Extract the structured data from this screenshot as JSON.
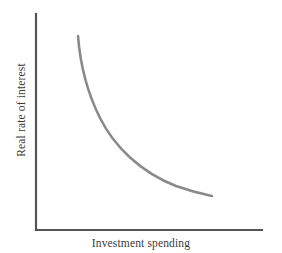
{
  "figure": {
    "kind": "investment-demand-curve",
    "background_color": "#ffffff",
    "width": 282,
    "height": 253
  },
  "axes": {
    "color": "#555555",
    "stroke_width": 2.2,
    "origin": {
      "x": 36,
      "y": 230
    },
    "y_axis_top": {
      "x": 36,
      "y": 14
    },
    "x_axis_right": {
      "x": 262,
      "y": 230
    },
    "x_label": "Investment spending",
    "y_label": "Real rate of interest",
    "label_color": "#3b3b3b",
    "ticks": [],
    "tick_labels": []
  },
  "chart_data": {
    "type": "line",
    "title": "",
    "xlabel": "Investment spending",
    "ylabel": "Real rate of interest",
    "xlim": [
      0,
      100
    ],
    "ylim": [
      0,
      100
    ],
    "grid": false,
    "legend": "none",
    "series": [
      {
        "name": "Investment demand",
        "color": "#8a8a8a",
        "shape": "convex-decreasing-hyperbola",
        "x": [
          18.6,
          20.0,
          22.1,
          25.2,
          29.2,
          34.1,
          39.8,
          46.0,
          52.7,
          59.7,
          66.8,
          73.9,
          78.0
        ],
        "y": [
          89.8,
          83.0,
          74.5,
          65.3,
          56.1,
          47.6,
          40.1,
          33.5,
          28.0,
          23.5,
          20.2,
          18.2,
          17.6
        ],
        "pixel_points": [
          [
            78,
            36
          ],
          [
            81,
            50
          ],
          [
            86,
            67
          ],
          [
            93,
            86
          ],
          [
            102,
            105
          ],
          [
            113,
            122
          ],
          [
            126,
            137
          ],
          [
            140,
            150
          ],
          [
            155,
            161
          ],
          [
            171,
            170
          ],
          [
            187,
            177
          ],
          [
            203,
            181
          ],
          [
            212,
            196
          ]
        ]
      }
    ],
    "annotations": []
  },
  "curve": {
    "color": "#8a8a8a",
    "stroke_width": 2.6,
    "path": "M 78 36 C 80 62, 86 90, 100 118 C 114 146, 140 172, 176 186 C 190 191, 202 194, 212 196",
    "start_point": {
      "x": 78,
      "y": 36
    },
    "end_point": {
      "x": 212,
      "y": 196
    }
  }
}
